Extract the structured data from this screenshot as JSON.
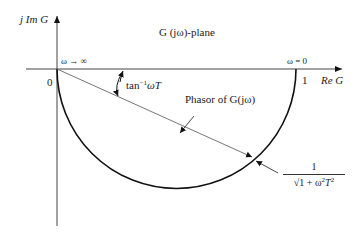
{
  "diagram": {
    "title": "G (jω)-plane",
    "axes": {
      "y_label": "j Im G",
      "x_label": "Re G",
      "origin_label": "0",
      "unit_label": "1"
    },
    "annotations": {
      "omega_infinity": "ω → ∞",
      "omega_zero": "ω = 0",
      "angle_label_base": "tan",
      "angle_label_sup": "−1",
      "angle_label_tail": "ωT",
      "phasor_label": "Phasor of G(jω)",
      "magnitude_numerator": "1",
      "magnitude_denominator_pre": "√1 + ω",
      "magnitude_denominator_sup1": "2",
      "magnitude_denominator_mid": "T",
      "magnitude_denominator_sup2": "2"
    },
    "geometry": {
      "origin": [
        57,
        69
      ],
      "unit_point": [
        296,
        69
      ],
      "circle_center": [
        176.5,
        69
      ],
      "circle_radius": 119.5,
      "phasor_tip": [
        255,
        159
      ]
    }
  }
}
